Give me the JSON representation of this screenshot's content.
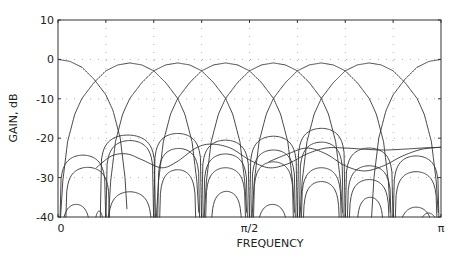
{
  "chart_data": {
    "type": "line",
    "title": "",
    "xlabel": "FREQUENCY",
    "ylabel": "GAIN, dB",
    "xlim": [
      0,
      1
    ],
    "x_units": "fraction of pi",
    "ylim": [
      -40,
      10
    ],
    "yticks": [
      10,
      0,
      -10,
      -20,
      -30,
      -40
    ],
    "ytick_labels": [
      "10",
      "0",
      "-10",
      "-20",
      "-30",
      "-40"
    ],
    "xticks": [
      0,
      0.5,
      1
    ],
    "xtick_labels": [
      "0",
      "π/2",
      "π"
    ],
    "grid": {
      "on": true,
      "style": "dotted",
      "x_every": 0.125,
      "y_every": 10
    },
    "legend": null,
    "main_lobe_profile": {
      "description": "relative gain (dB) vs offset from band center in units of pi/8",
      "offset": [
        0,
        0.25,
        0.5,
        0.75,
        1.0,
        1.15,
        1.3,
        1.4,
        1.45
      ],
      "rel_db": [
        0,
        -0.5,
        -2.0,
        -5.0,
        -9.0,
        -13.0,
        -20.0,
        -30.0,
        -40.0
      ]
    },
    "main_filters": [
      {
        "name": "band 0 (lowpass)",
        "center": 0.0,
        "peak_db": 0.0
      },
      {
        "name": "band 1",
        "center": 0.1875,
        "peak_db": -0.9
      },
      {
        "name": "band 2",
        "center": 0.3125,
        "peak_db": -0.9
      },
      {
        "name": "band 3",
        "center": 0.4375,
        "peak_db": -0.9
      },
      {
        "name": "band 4",
        "center": 0.5625,
        "peak_db": -0.9
      },
      {
        "name": "band 5",
        "center": 0.6875,
        "peak_db": -0.9
      },
      {
        "name": "band 6",
        "center": 0.8125,
        "peak_db": -0.9
      },
      {
        "name": "band 7 (highpass)",
        "center": 1.0,
        "peak_db": 0.0
      }
    ],
    "sidelobe_arcs": [
      {
        "start": 0.005,
        "end": 0.125,
        "peak_db": -24.3
      },
      {
        "start": 0.02,
        "end": 0.135,
        "peak_db": -27.4
      },
      {
        "start": 0.01,
        "end": 0.085,
        "peak_db": -36.8
      },
      {
        "start": 0.11,
        "end": 0.255,
        "peak_db": -19.2
      },
      {
        "start": 0.125,
        "end": 0.25,
        "peak_db": -20.6
      },
      {
        "start": 0.13,
        "end": 0.245,
        "peak_db": -33.6
      },
      {
        "start": 0.095,
        "end": 0.12,
        "peak_db": -38.5
      },
      {
        "start": 0.25,
        "end": 0.375,
        "peak_db": -18.8
      },
      {
        "start": 0.26,
        "end": 0.37,
        "peak_db": -22.6
      },
      {
        "start": 0.265,
        "end": 0.36,
        "peak_db": -28.0
      },
      {
        "start": 0.375,
        "end": 0.5,
        "peak_db": -20.5
      },
      {
        "start": 0.38,
        "end": 0.495,
        "peak_db": -24.0
      },
      {
        "start": 0.385,
        "end": 0.49,
        "peak_db": -27.5
      },
      {
        "start": 0.4,
        "end": 0.48,
        "peak_db": -33.5
      },
      {
        "start": 0.5,
        "end": 0.625,
        "peak_db": -19.5
      },
      {
        "start": 0.505,
        "end": 0.62,
        "peak_db": -23.0
      },
      {
        "start": 0.51,
        "end": 0.615,
        "peak_db": -26.0
      },
      {
        "start": 0.52,
        "end": 0.6,
        "peak_db": -36.8
      },
      {
        "start": 0.625,
        "end": 0.75,
        "peak_db": -17.5
      },
      {
        "start": 0.63,
        "end": 0.745,
        "peak_db": -21.0
      },
      {
        "start": 0.635,
        "end": 0.74,
        "peak_db": -27.5
      },
      {
        "start": 0.64,
        "end": 0.735,
        "peak_db": -31.0
      },
      {
        "start": 0.75,
        "end": 0.875,
        "peak_db": -22.5
      },
      {
        "start": 0.755,
        "end": 0.87,
        "peak_db": -27.0
      },
      {
        "start": 0.76,
        "end": 0.865,
        "peak_db": -30.5
      },
      {
        "start": 0.78,
        "end": 0.85,
        "peak_db": -35.0
      },
      {
        "start": 0.875,
        "end": 0.995,
        "peak_db": -24.5
      },
      {
        "start": 0.88,
        "end": 0.99,
        "peak_db": -28.5
      },
      {
        "start": 0.89,
        "end": 0.98,
        "peak_db": -37.5
      },
      {
        "start": 0.94,
        "end": 0.995,
        "peak_db": -39.0
      }
    ],
    "wavy_curves": [
      {
        "name": "aliasing curve A",
        "x": [
          0.1,
          0.14,
          0.18,
          0.22,
          0.27,
          0.31,
          0.36,
          0.4,
          0.45,
          0.5,
          0.55,
          0.6,
          0.65,
          0.7,
          0.75,
          0.8,
          0.85,
          0.9,
          0.95,
          1.0
        ],
        "y": [
          -27.5,
          -24.5,
          -24.0,
          -25.5,
          -27.5,
          -26.0,
          -22.5,
          -21.5,
          -22.5,
          -25.5,
          -27.5,
          -26.5,
          -24.0,
          -22.5,
          -22.5,
          -22.8,
          -23.0,
          -22.8,
          -22.5,
          -22.3
        ]
      },
      {
        "name": "aliasing curve B",
        "x": [
          0.55,
          0.6,
          0.65,
          0.7,
          0.75,
          0.8,
          0.85,
          0.9,
          0.95,
          1.0
        ],
        "y": [
          -26.0,
          -24.0,
          -22.5,
          -24.0,
          -27.0,
          -28.3,
          -27.0,
          -24.5,
          -22.8,
          -22.3
        ]
      }
    ],
    "colors": {
      "curve": "#333333",
      "axis": "#333333",
      "grid": "#b0b0b0",
      "background": "#ffffff"
    }
  }
}
